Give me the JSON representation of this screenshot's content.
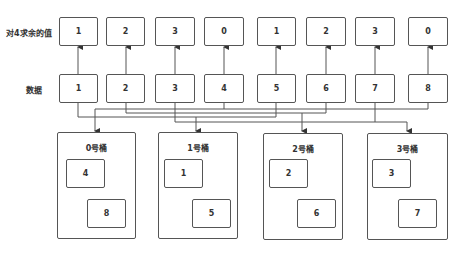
{
  "labels": {
    "remainder_row": "对4求余的值",
    "data_row": "数据"
  },
  "remainders": [
    "1",
    "2",
    "3",
    "0",
    "1",
    "2",
    "3",
    "0"
  ],
  "data": [
    "1",
    "2",
    "3",
    "4",
    "5",
    "6",
    "7",
    "8"
  ],
  "buckets": [
    {
      "title": "0号桶",
      "items": [
        "4",
        "8"
      ]
    },
    {
      "title": "1号桶",
      "items": [
        "1",
        "5"
      ]
    },
    {
      "title": "2号桶",
      "items": [
        "2",
        "6"
      ]
    },
    {
      "title": "3号桶",
      "items": [
        "3",
        "7"
      ]
    }
  ],
  "colors": {
    "stroke": "#555555",
    "text": "#333333",
    "background": "#ffffff"
  }
}
